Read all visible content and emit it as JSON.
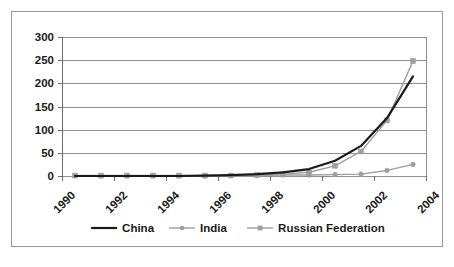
{
  "chart_data": {
    "type": "line",
    "title": "",
    "subtitle": "",
    "xlabel": "",
    "ylabel": "",
    "x": [
      1990,
      1991,
      1992,
      1993,
      1994,
      1995,
      1996,
      1997,
      1998,
      1999,
      2000,
      2001,
      2002,
      2003
    ],
    "xtick_labels": [
      "1990",
      "1992",
      "1994",
      "1996",
      "1998",
      "2000",
      "2002",
      "2004"
    ],
    "xtick_values": [
      1990,
      1992,
      1994,
      1996,
      1998,
      2000,
      2002,
      2004
    ],
    "ytick_labels": [
      "0",
      "50",
      "100",
      "150",
      "200",
      "250",
      "300"
    ],
    "ytick_values": [
      0,
      50,
      100,
      150,
      200,
      250,
      300
    ],
    "ylim": [
      0,
      300
    ],
    "grid": "horizontal",
    "legend_position": "bottom",
    "series": [
      {
        "name": "China",
        "color": "#1a1a1a",
        "marker": "none",
        "line_width": 2.2,
        "values": [
          0,
          0,
          0,
          0,
          0,
          1,
          2,
          4,
          8,
          15,
          33,
          65,
          125,
          215
        ]
      },
      {
        "name": "India",
        "color": "#9e9e9e",
        "marker": "circle",
        "line_width": 1.4,
        "values": [
          0,
          0,
          0,
          0,
          0,
          0,
          1,
          1,
          2,
          2,
          3,
          4,
          12,
          25
        ]
      },
      {
        "name": "Russian Federation",
        "color": "#9e9e9e",
        "marker": "square",
        "line_width": 1.4,
        "values": [
          1,
          1,
          1,
          1,
          1,
          1,
          1,
          2,
          4,
          8,
          22,
          53,
          120,
          248
        ]
      }
    ]
  },
  "legend": {
    "items": [
      {
        "label": "China"
      },
      {
        "label": "India"
      },
      {
        "label": "Russian Federation"
      }
    ]
  },
  "axes": {
    "y_labels": [
      "300",
      "250",
      "200",
      "150",
      "100",
      "50",
      "0"
    ],
    "x_labels": [
      "1990",
      "1992",
      "1994",
      "1996",
      "1998",
      "2000",
      "2002",
      "2004"
    ]
  },
  "colors": {
    "china": "#1a1a1a",
    "india": "#9e9e9e",
    "russia": "#9e9e9e",
    "grid": "#8f8f8f",
    "border": "#9a9a9a",
    "text": "#1a1a1a",
    "background": "#ffffff"
  }
}
